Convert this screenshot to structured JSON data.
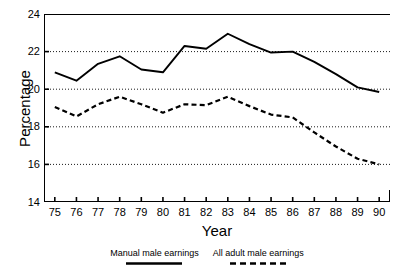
{
  "chart_data": {
    "type": "line",
    "title": "",
    "xlabel": "Year",
    "ylabel": "Percentage",
    "x": [
      75,
      76,
      77,
      78,
      79,
      80,
      81,
      82,
      83,
      84,
      85,
      86,
      87,
      88,
      89,
      90
    ],
    "categories": [
      "75",
      "76",
      "77",
      "78",
      "79",
      "80",
      "81",
      "82",
      "83",
      "84",
      "85",
      "86",
      "87",
      "88",
      "89",
      "90"
    ],
    "xlim": [
      74.5,
      90.5
    ],
    "ylim": [
      14,
      24
    ],
    "yticks": [
      14,
      16,
      18,
      20,
      22,
      24
    ],
    "ytick_labels": [
      "14",
      "16",
      "18",
      "20",
      "22",
      "24"
    ],
    "gridlines_y": [
      16,
      18,
      20,
      22
    ],
    "grid": "horizontal-dotted",
    "legend_position": "below-axis",
    "series": [
      {
        "name": "Manual male earnings",
        "style": "solid",
        "color": "#000000",
        "values": [
          20.9,
          20.45,
          21.35,
          21.75,
          21.05,
          20.9,
          22.3,
          22.15,
          22.95,
          22.4,
          21.95,
          22.0,
          21.45,
          20.8,
          20.1,
          19.85
        ]
      },
      {
        "name": "All adult male earnings",
        "style": "dashed",
        "color": "#000000",
        "values": [
          19.05,
          18.55,
          19.2,
          19.6,
          19.2,
          18.75,
          19.2,
          19.15,
          19.6,
          19.1,
          18.65,
          18.5,
          17.7,
          16.95,
          16.3,
          16.0
        ]
      }
    ]
  },
  "legend": {
    "entries": [
      {
        "label": "Manual male earnings",
        "style": "solid"
      },
      {
        "label": "All adult male earnings",
        "style": "dashed"
      }
    ]
  }
}
